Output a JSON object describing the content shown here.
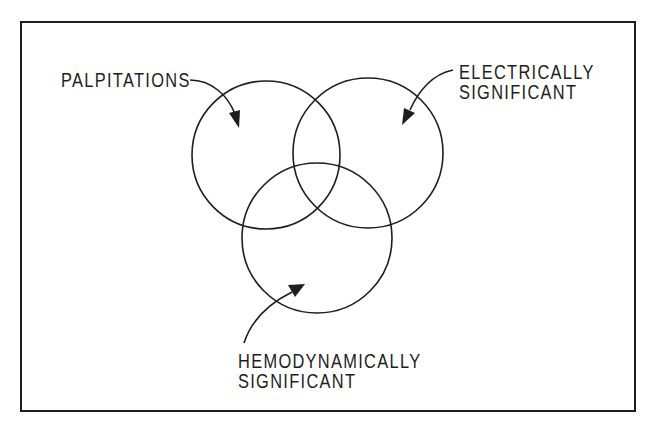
{
  "diagram": {
    "type": "venn",
    "sets": [
      {
        "id": "palpitations",
        "label_lines": [
          "PALPITATIONS"
        ]
      },
      {
        "id": "electrically_significant",
        "label_lines": [
          "ELECTRICALLY",
          "SIGNIFICANT"
        ]
      },
      {
        "id": "hemodynamically_significant",
        "label_lines": [
          "HEMODYNAMICALLY",
          "SIGNIFICANT"
        ]
      }
    ],
    "colors": {
      "ink": "#1e1e1e",
      "background": "#ffffff"
    }
  },
  "labels": {
    "palpitations": {
      "line1": "PALPITATIONS"
    },
    "electrical": {
      "line1": "ELECTRICALLY",
      "line2": "SIGNIFICANT"
    },
    "hemodynamic": {
      "line1": "HEMODYNAMICALLY",
      "line2": "SIGNIFICANT"
    }
  }
}
